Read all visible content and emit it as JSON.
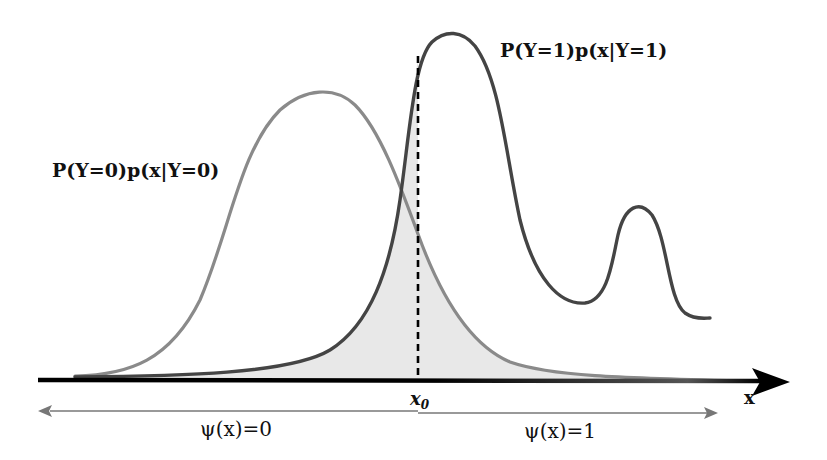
{
  "figure": {
    "type": "bayes-decision-boundary-illustration",
    "labels": {
      "class1_density": "P(Y=1)p(x|Y=1)",
      "class0_density": "P(Y=0)p(x|Y=0)",
      "threshold": "x",
      "threshold_subscript": "0",
      "axis": "x",
      "region_left": "ψ(x)=0",
      "region_right": "ψ(x)=1"
    },
    "colors": {
      "class1_curve": "#444444",
      "class0_curve": "#8a8a8a",
      "error_shading": "#e6e6e6",
      "axis": "#000000",
      "region_arrows": "#777777",
      "threshold_line": "#000000"
    },
    "annotations": {
      "shaded_region": "overlap area between the two weighted densities (Bayes error)",
      "threshold_style": "dashed vertical line at x0"
    }
  }
}
